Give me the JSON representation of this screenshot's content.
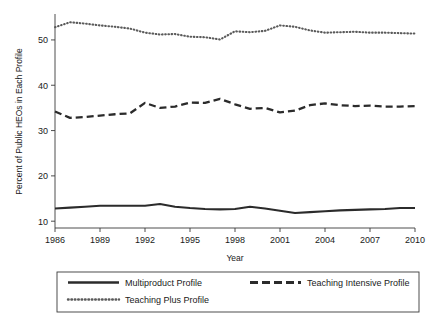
{
  "chart_data": {
    "type": "line",
    "title": "",
    "xlabel": "Year",
    "ylabel": "Percent of Public HEOs in Each Profile",
    "xlim": [
      1986,
      2010
    ],
    "ylim": [
      8.5,
      55.5
    ],
    "grid": false,
    "legend_position": "below",
    "x": [
      1986,
      1987,
      1988,
      1989,
      1990,
      1991,
      1992,
      1993,
      1994,
      1995,
      1996,
      1997,
      1998,
      1999,
      2000,
      2001,
      2002,
      2003,
      2004,
      2005,
      2006,
      2007,
      2008,
      2009,
      2010
    ],
    "xticks": [
      1986,
      1989,
      1992,
      1995,
      1998,
      2001,
      2004,
      2007,
      2010
    ],
    "xtick_labels": [
      "1986",
      "1989",
      "1992",
      "1995",
      "1998",
      "2001",
      "2004",
      "2007",
      "2010"
    ],
    "yticks": [
      10,
      20,
      30,
      40,
      50
    ],
    "ytick_labels": [
      "10",
      "20",
      "30",
      "40",
      "50"
    ],
    "series": [
      {
        "name": "Multiproduct Profile",
        "style": "solid",
        "color": "#2b2b2b",
        "values": [
          12.8,
          13.0,
          13.2,
          13.4,
          13.4,
          13.4,
          13.4,
          13.8,
          13.2,
          12.9,
          12.7,
          12.6,
          12.7,
          13.2,
          12.8,
          12.3,
          11.8,
          12.0,
          12.2,
          12.4,
          12.5,
          12.6,
          12.7,
          12.9,
          12.9
        ]
      },
      {
        "name": "Teaching Intensive Profile",
        "style": "dashed",
        "color": "#2b2b2b",
        "values": [
          34.2,
          32.8,
          33.0,
          33.3,
          33.6,
          33.8,
          36.1,
          35.0,
          35.3,
          36.2,
          36.1,
          37.0,
          35.8,
          34.8,
          35.0,
          34.0,
          34.4,
          35.6,
          36.0,
          35.6,
          35.4,
          35.5,
          35.3,
          35.3,
          35.4
        ]
      },
      {
        "name": "Teaching Plus Profile",
        "style": "dotted",
        "color": "#5a5a5a",
        "values": [
          52.8,
          53.9,
          53.6,
          53.2,
          52.9,
          52.5,
          51.6,
          51.2,
          51.3,
          50.7,
          50.6,
          50.1,
          51.9,
          51.7,
          52.0,
          53.2,
          52.9,
          52.1,
          51.6,
          51.7,
          51.8,
          51.6,
          51.6,
          51.5,
          51.4
        ]
      }
    ]
  },
  "legend": {
    "entries": [
      {
        "label": "Multiproduct Profile",
        "style": "solid"
      },
      {
        "label": "Teaching Intensive Profile",
        "style": "dashed"
      },
      {
        "label": "Teaching Plus Profile",
        "style": "dotted"
      }
    ]
  }
}
